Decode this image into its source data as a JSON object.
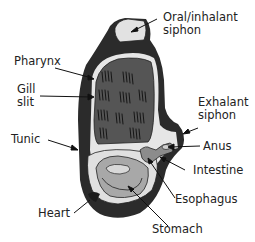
{
  "diagram": {
    "colors": {
      "tunic": "#2b2b2b",
      "pharynx": "#555555",
      "gill_slit": "#1a1a1a",
      "inner_space": "#e6e6e6",
      "stomach": "#a8a8a8",
      "intestine": "#8c8c8c",
      "label_text": "#222222"
    },
    "labels": {
      "oral_siphon": "Oral/inhalant siphon",
      "oral_siphon_line1": "Oral/inhalant",
      "oral_siphon_line2": "siphon",
      "pharynx": "Pharynx",
      "gill_slit_line1": "Gill",
      "gill_slit_line2": "slit",
      "exhalant_siphon_line1": "Exhalant",
      "exhalant_siphon_line2": "siphon",
      "tunic": "Tunic",
      "anus": "Anus",
      "intestine": "Intestine",
      "esophagus": "Esophagus",
      "heart": "Heart",
      "stomach": "Stomach"
    }
  }
}
